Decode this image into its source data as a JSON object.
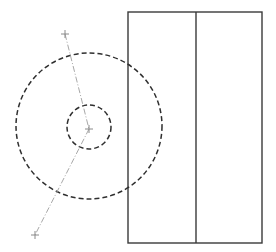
{
  "diagram": {
    "width": 276,
    "height": 252,
    "background": "#ffffff",
    "colors": {
      "rectangle_stroke": "#3a3a3a",
      "circle_stroke": "#2f2f2f",
      "guide_line": "#a8a8a8",
      "crosshair": "#8a8a8a"
    },
    "rectangle": {
      "x": 128,
      "y": 12,
      "width": 134,
      "height": 231,
      "divider_x": 196
    },
    "circles": [
      {
        "name": "outer-dashed-circle",
        "cx": 89,
        "cy": 126,
        "r": 73
      },
      {
        "name": "inner-dashed-circle",
        "cx": 89,
        "cy": 127,
        "r": 22
      }
    ],
    "guide_lines": [
      {
        "name": "upper-guide-line",
        "x1": 65,
        "y1": 34,
        "x2": 89,
        "y2": 129
      },
      {
        "name": "lower-guide-line",
        "x1": 89,
        "y1": 129,
        "x2": 35,
        "y2": 235
      }
    ],
    "crosshairs": [
      {
        "name": "top-crosshair",
        "x": 65,
        "y": 34
      },
      {
        "name": "center-crosshair",
        "x": 89,
        "y": 129
      },
      {
        "name": "bottom-crosshair",
        "x": 35,
        "y": 235
      }
    ]
  }
}
